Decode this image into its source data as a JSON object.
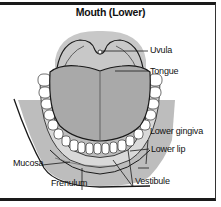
{
  "title": "Mouth (Lower)",
  "labels": {
    "uvula": "Uvula",
    "tongue": "Tongue",
    "lower_gingiva": "Lower gingiva",
    "lower_lip": "Lower lip",
    "mucosa": "Mucosa",
    "frenulum": "Frenulum",
    "vestibule": "Vestibule"
  },
  "colors": {
    "tissue_gray": "#b9b9b9",
    "tongue_gray": "#a9a9a9",
    "light_gray": "#d6d6d6",
    "outline": "#1a1a1a",
    "teeth": "#ffffff"
  }
}
